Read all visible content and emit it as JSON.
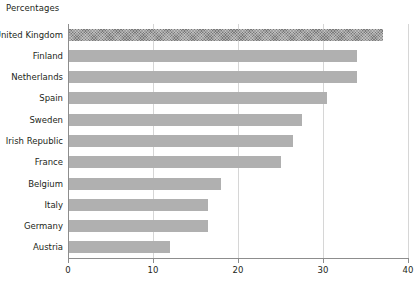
{
  "chart_data": {
    "type": "bar",
    "orientation": "horizontal",
    "title": "Percentages",
    "xlabel": "",
    "ylabel": "",
    "xlim": [
      0,
      40
    ],
    "xticks": [
      0,
      10,
      20,
      30,
      40
    ],
    "grid": "vertical",
    "legend": "none",
    "categories": [
      "United Kingdom",
      "Finland",
      "Netherlands",
      "Spain",
      "Sweden",
      "Irish Republic",
      "France",
      "Belgium",
      "Italy",
      "Germany",
      "Austria"
    ],
    "values": [
      37,
      34,
      34,
      30.5,
      27.5,
      26.5,
      25,
      18,
      16.5,
      16.5,
      12
    ],
    "highlight_index": 0,
    "colors": {
      "bar": "#b0b0b0",
      "highlight_bar": "#7a7a7a",
      "gridline": "#d6d6d6",
      "axis": "#8d8d8d",
      "text": "#231f20",
      "background": "#ffffff"
    }
  }
}
